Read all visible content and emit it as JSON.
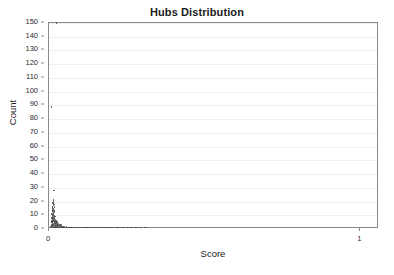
{
  "chart_data": {
    "type": "scatter",
    "title": "Hubs Distribution",
    "xlabel": "Score",
    "ylabel": "Count",
    "xlim": [
      0,
      1.06
    ],
    "ylim": [
      0,
      150
    ],
    "grid": true,
    "legend": null,
    "x_tick_labels": [
      "0",
      "1"
    ],
    "x_tick_values": [
      0,
      1
    ],
    "y_tick_labels": [
      "0",
      "10",
      "20",
      "30",
      "40",
      "50",
      "60",
      "70",
      "80",
      "90",
      "100",
      "110",
      "120",
      "130",
      "140",
      "150"
    ],
    "y_tick_values": [
      0,
      10,
      20,
      30,
      40,
      50,
      60,
      70,
      80,
      90,
      100,
      110,
      120,
      130,
      140,
      150
    ],
    "marker_color": "#4a4a4a",
    "grid_color": "#efefef",
    "frame_color": "#8a8a8a",
    "points": [
      [
        0.024,
        150
      ],
      [
        0.008,
        89
      ],
      [
        0.016,
        28
      ],
      [
        0.014,
        21
      ],
      [
        0.015,
        20
      ],
      [
        0.013,
        19
      ],
      [
        0.016,
        18
      ],
      [
        0.014,
        17
      ],
      [
        0.012,
        16
      ],
      [
        0.017,
        16
      ],
      [
        0.013,
        15
      ],
      [
        0.015,
        14
      ],
      [
        0.011,
        14
      ],
      [
        0.016,
        13
      ],
      [
        0.012,
        13
      ],
      [
        0.014,
        12
      ],
      [
        0.018,
        12
      ],
      [
        0.01,
        11
      ],
      [
        0.015,
        11
      ],
      [
        0.013,
        10
      ],
      [
        0.017,
        10
      ],
      [
        0.011,
        9
      ],
      [
        0.014,
        9
      ],
      [
        0.019,
        9
      ],
      [
        0.012,
        8
      ],
      [
        0.016,
        8
      ],
      [
        0.009,
        8
      ],
      [
        0.013,
        7
      ],
      [
        0.018,
        7
      ],
      [
        0.021,
        7
      ],
      [
        0.01,
        6
      ],
      [
        0.015,
        6
      ],
      [
        0.02,
        6
      ],
      [
        0.024,
        6
      ],
      [
        0.012,
        5
      ],
      [
        0.017,
        5
      ],
      [
        0.022,
        5
      ],
      [
        0.026,
        5
      ],
      [
        0.008,
        5
      ],
      [
        0.011,
        4
      ],
      [
        0.014,
        4
      ],
      [
        0.019,
        4
      ],
      [
        0.023,
        4
      ],
      [
        0.028,
        4
      ],
      [
        0.031,
        4
      ],
      [
        0.009,
        3
      ],
      [
        0.013,
        3
      ],
      [
        0.017,
        3
      ],
      [
        0.021,
        3
      ],
      [
        0.025,
        3
      ],
      [
        0.029,
        3
      ],
      [
        0.034,
        3
      ],
      [
        0.038,
        3
      ],
      [
        0.007,
        2
      ],
      [
        0.01,
        2
      ],
      [
        0.014,
        2
      ],
      [
        0.018,
        2
      ],
      [
        0.022,
        2
      ],
      [
        0.026,
        2
      ],
      [
        0.03,
        2
      ],
      [
        0.035,
        2
      ],
      [
        0.04,
        2
      ],
      [
        0.045,
        2
      ],
      [
        0.05,
        2
      ],
      [
        0.056,
        2
      ],
      [
        0.005,
        1
      ],
      [
        0.008,
        1
      ],
      [
        0.011,
        1
      ],
      [
        0.015,
        1
      ],
      [
        0.019,
        1
      ],
      [
        0.023,
        1
      ],
      [
        0.027,
        1
      ],
      [
        0.031,
        1
      ],
      [
        0.036,
        1
      ],
      [
        0.041,
        1
      ],
      [
        0.046,
        1
      ],
      [
        0.052,
        1
      ],
      [
        0.058,
        1
      ],
      [
        0.064,
        1
      ],
      [
        0.07,
        1
      ],
      [
        0.076,
        1
      ],
      [
        0.082,
        1
      ],
      [
        0.088,
        1
      ],
      [
        0.094,
        1
      ],
      [
        0.101,
        1
      ],
      [
        0.108,
        1
      ],
      [
        0.115,
        1
      ],
      [
        0.122,
        1
      ],
      [
        0.13,
        1
      ],
      [
        0.138,
        1
      ],
      [
        0.147,
        1
      ],
      [
        0.156,
        1
      ],
      [
        0.166,
        1
      ],
      [
        0.176,
        1
      ],
      [
        0.186,
        1
      ],
      [
        0.196,
        1
      ],
      [
        0.207,
        1
      ],
      [
        0.218,
        1
      ],
      [
        0.23,
        1
      ],
      [
        0.242,
        1
      ],
      [
        0.255,
        1
      ],
      [
        0.268,
        1
      ],
      [
        0.282,
        1
      ],
      [
        0.296,
        1
      ],
      [
        0.311,
        1
      ],
      [
        0.02,
        1
      ],
      [
        0.033,
        1
      ],
      [
        0.043,
        1
      ],
      [
        0.048,
        1
      ],
      [
        0.061,
        1
      ],
      [
        0.067,
        1
      ],
      [
        0.073,
        1
      ],
      [
        0.079,
        1
      ],
      [
        0.085,
        1
      ],
      [
        0.091,
        1
      ],
      [
        0.098,
        1
      ],
      [
        0.105,
        1
      ],
      [
        0.112,
        1
      ],
      [
        0.119,
        1
      ],
      [
        0.126,
        1
      ],
      [
        0.134,
        1
      ],
      [
        0.143,
        1
      ],
      [
        0.152,
        1
      ],
      [
        0.161,
        1
      ],
      [
        0.171,
        1
      ],
      [
        0.181,
        1
      ],
      [
        0.191,
        1
      ],
      [
        0.202,
        1
      ],
      [
        0.213,
        1
      ],
      [
        0.225,
        1
      ],
      [
        0.237,
        1
      ],
      [
        0.25,
        1
      ],
      [
        0.263,
        1
      ],
      [
        0.277,
        1
      ],
      [
        0.291,
        1
      ],
      [
        0.306,
        1
      ]
    ]
  }
}
